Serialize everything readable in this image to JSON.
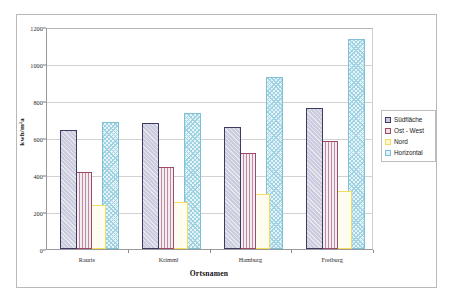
{
  "chart_data": {
    "type": "bar",
    "title": "",
    "categories": [
      "Rauris",
      "Krimml",
      "Hamburg",
      "Freiburg"
    ],
    "series": [
      {
        "name": "Südfläche",
        "values": [
          645,
          680,
          662,
          760
        ],
        "color": "#ccccdf",
        "border": "#3b3b63"
      },
      {
        "name": "Ost - West",
        "values": [
          418,
          445,
          520,
          585
        ],
        "color": "#f0dde4",
        "border": "#9c4a68"
      },
      {
        "name": "Nord",
        "values": [
          238,
          255,
          300,
          313
        ],
        "color": "#fff8cc",
        "border": "#f2dd5e"
      },
      {
        "name": "Horizontal",
        "values": [
          685,
          735,
          930,
          1135
        ],
        "color": "#dff0f6",
        "border": "#7fc0d4"
      }
    ],
    "xlabel": "Ortsnamen",
    "ylabel": "kwh/m²a",
    "ylim": [
      0,
      1200
    ],
    "ytick_step": 200,
    "yticks": [
      0,
      200,
      400,
      600,
      800,
      1000,
      1200
    ],
    "grid": true,
    "legend_position": "right"
  },
  "legend": {
    "items": [
      {
        "label": "Südfläche"
      },
      {
        "label": "Ost - West"
      },
      {
        "label": "Nord"
      },
      {
        "label": "Horizontal"
      }
    ]
  },
  "axes": {
    "y_title": "kwh/m²a",
    "x_title": "Ortsnamen"
  }
}
